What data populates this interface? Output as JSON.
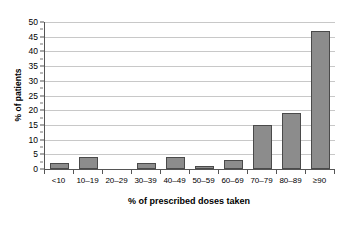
{
  "chart_data": {
    "type": "bar",
    "title": "",
    "xlabel": "% of prescribed doses taken",
    "ylabel": "% of patients",
    "categories": [
      "<10",
      "10–19",
      "20–29",
      "30–39",
      "40–49",
      "50–59",
      "60–69",
      "70–79",
      "80–89",
      "≥90"
    ],
    "values": [
      2,
      4,
      0,
      2,
      4,
      1,
      3,
      15,
      19,
      47
    ],
    "ylim": [
      0,
      50
    ],
    "ytick_labels": [
      "50",
      "45",
      "40",
      "35",
      "30",
      "25",
      "20",
      "15",
      "10",
      "5",
      "0"
    ],
    "ytick_values": [
      50,
      45,
      40,
      35,
      30,
      25,
      20,
      15,
      10,
      5,
      0
    ],
    "grid": true,
    "legend": "none",
    "bar_color": "#8c8c8c",
    "bar_edge_color": "#4a4a4a",
    "grid_color": "#c8c8c8",
    "axis_color": "#555555",
    "background": "#ffffff"
  }
}
